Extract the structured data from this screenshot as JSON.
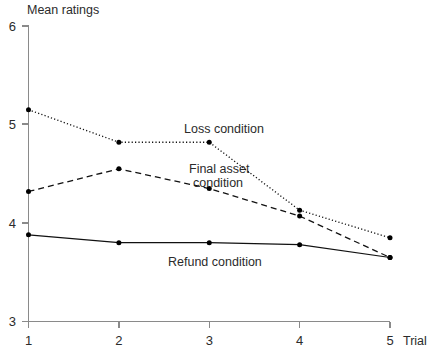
{
  "chart_data": {
    "type": "line",
    "title": "Mean ratings",
    "xlabel": "Trial",
    "ylabel": "Mean ratings",
    "x": [
      1,
      2,
      3,
      4,
      5
    ],
    "categories": [
      "1",
      "2",
      "3",
      "4",
      "5"
    ],
    "xlim": [
      1,
      5
    ],
    "ylim": [
      3,
      6
    ],
    "xticks": [
      "1",
      "2",
      "3",
      "4",
      "5"
    ],
    "yticks": [
      "3",
      "4",
      "5",
      "6"
    ],
    "grid": false,
    "legend_position": "inline-annotations",
    "series": [
      {
        "name": "Loss condition",
        "style": "dotted",
        "values": [
          5.15,
          4.82,
          4.82,
          4.13,
          3.85
        ]
      },
      {
        "name": "Final asset condition",
        "style": "dashed",
        "values": [
          4.32,
          4.55,
          4.35,
          4.07,
          3.65
        ]
      },
      {
        "name": "Refund condition",
        "style": "solid",
        "values": [
          3.88,
          3.8,
          3.8,
          3.78,
          3.65
        ]
      }
    ],
    "annotations": [
      {
        "text": "Loss condition",
        "x": 2.95,
        "y": 4.98
      },
      {
        "text": "Final asset",
        "x": 2.85,
        "y": 4.58
      },
      {
        "text": "condition",
        "x": 2.9,
        "y": 4.46
      },
      {
        "text": "Refund condition",
        "x": 2.55,
        "y": 3.68
      }
    ],
    "colors": {
      "background": "#ffffff",
      "axis": "#8a8a8a",
      "line": "#111111",
      "text": "#2b2b2b"
    }
  },
  "labels": {
    "y_axis_title": "Mean ratings",
    "x_axis_title": "Trial",
    "y_tick_6": "6",
    "y_tick_5": "5",
    "y_tick_4": "4",
    "y_tick_3": "3",
    "x_tick_1": "1",
    "x_tick_2": "2",
    "x_tick_3": "3",
    "x_tick_4": "4",
    "x_tick_5": "5",
    "series_loss": "Loss condition",
    "series_final_asset_line1": "Final asset",
    "series_final_asset_line2": "condition",
    "series_refund": "Refund condition"
  }
}
